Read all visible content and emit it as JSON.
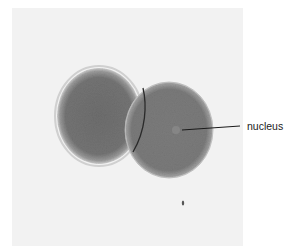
{
  "figure": {
    "annotations": [
      {
        "label": "nucleus",
        "target": "right-cell-nucleus"
      }
    ]
  },
  "colors": {
    "background": "#ffffff",
    "photo_background": "#f2f2f2",
    "cell_fill": "#7a7a7a",
    "cell_halo": "#d6d6d6",
    "leader_line": "#1a1a1a",
    "label_text": "#222222"
  }
}
